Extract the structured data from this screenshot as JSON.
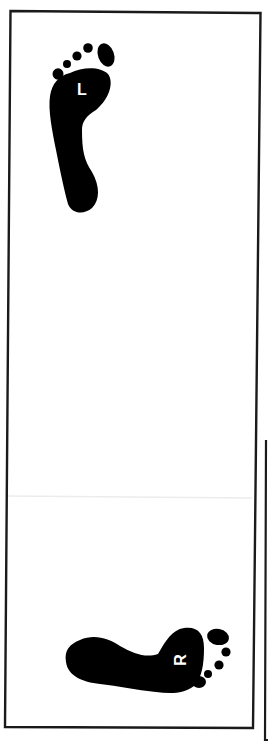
{
  "card": {
    "border_color": "#1a1a1a",
    "background": "#ffffff"
  },
  "footprints": [
    {
      "side": "left",
      "label": "L",
      "orientation": "upright",
      "color": "#000000"
    },
    {
      "side": "right",
      "label": "R",
      "orientation": "rotated-90",
      "color": "#000000"
    }
  ]
}
